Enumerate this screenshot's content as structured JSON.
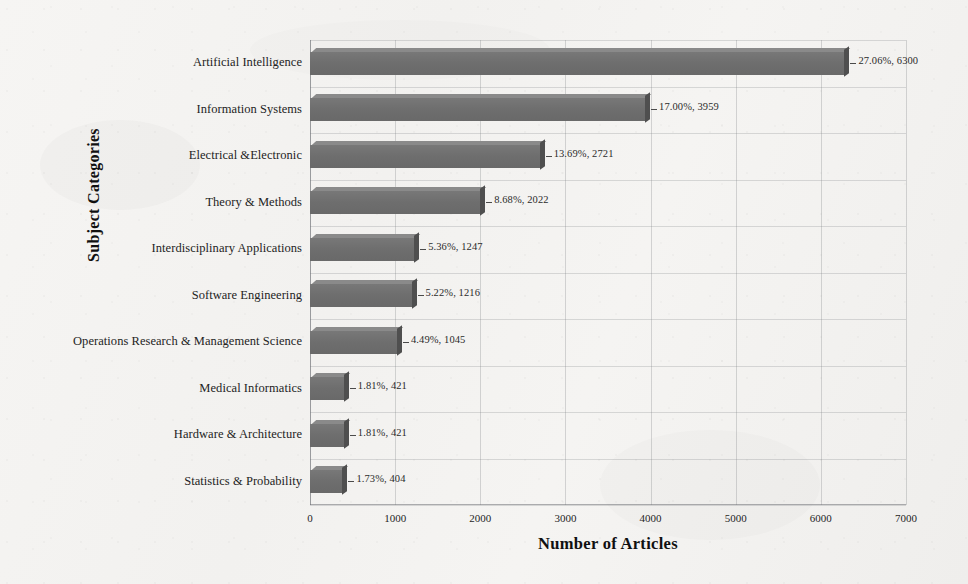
{
  "chart_data": {
    "type": "bar",
    "orientation": "horizontal",
    "title": "",
    "xlabel": "Number of Articles",
    "ylabel": "Subject Categories",
    "xlim": [
      0,
      7000
    ],
    "xticks": [
      0,
      1000,
      2000,
      3000,
      4000,
      5000,
      6000,
      7000
    ],
    "xtick_labels": [
      "0",
      "1000",
      "2000",
      "3000",
      "4000",
      "5000",
      "6000",
      "7000"
    ],
    "grid": true,
    "legend": "none",
    "categories": [
      "Artificial Intelligence",
      "Information Systems",
      "Electrical &Electronic",
      "Theory & Methods",
      "Interdisciplinary Applications",
      "Software Engineering",
      "Operations Research & Management Science",
      "Medical Informatics",
      "Hardware & Architecture",
      "Statistics & Probability"
    ],
    "values": [
      6300,
      3959,
      2721,
      2022,
      1247,
      1216,
      1045,
      421,
      421,
      404
    ],
    "percentages": [
      "27.06%",
      "17.00%",
      "13.69%",
      "8.68%",
      "5.36%",
      "5.22%",
      "4.49%",
      "1.81%",
      "1.81%",
      "1.73%"
    ],
    "data_labels": [
      "27.06%, 6300",
      "17.00%, 3959",
      "13.69%, 2721",
      "8.68%, 2022",
      "5.36%, 1247",
      "5.22%, 1216",
      "4.49%, 1045",
      "1.81%, 421",
      "1.81%, 421",
      "1.73%, 404"
    ],
    "bar_color": "#6e6e6e",
    "bar_edge_color": "#4f4f4f",
    "background_color": "#f3f3f1"
  }
}
